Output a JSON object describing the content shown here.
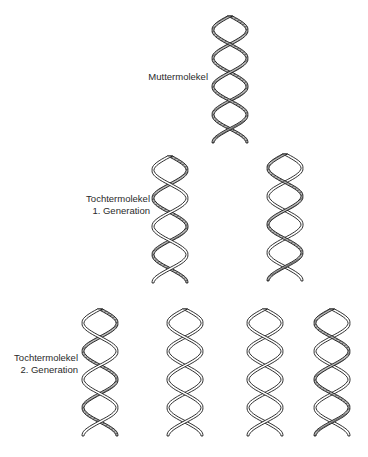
{
  "labels": {
    "mother": "Muttermolekel",
    "gen1_line1": "Tochtermolekel",
    "gen1_line2": "1. Generation",
    "gen2_line1": "Tochtermolekel",
    "gen2_line2": "2. Generation"
  },
  "colors": {
    "outline": "#1a1a1a",
    "hatched_fill": "#9a9a9a",
    "plain_fill": "#ffffff",
    "background": "#ffffff"
  },
  "molecules": [
    {
      "id": "mother",
      "generation": 0,
      "x": 210,
      "y": 12,
      "strand_a": "hatched",
      "strand_b": "hatched"
    },
    {
      "id": "gen1-left",
      "generation": 1,
      "x": 150,
      "y": 152,
      "strand_a": "hatched",
      "strand_b": "plain"
    },
    {
      "id": "gen1-right",
      "generation": 1,
      "x": 265,
      "y": 150,
      "strand_a": "plain",
      "strand_b": "hatched"
    },
    {
      "id": "gen2-1",
      "generation": 2,
      "x": 80,
      "y": 305,
      "strand_a": "hatched",
      "strand_b": "plain"
    },
    {
      "id": "gen2-2",
      "generation": 2,
      "x": 165,
      "y": 305,
      "strand_a": "plain",
      "strand_b": "plain"
    },
    {
      "id": "gen2-3",
      "generation": 2,
      "x": 245,
      "y": 305,
      "strand_a": "plain",
      "strand_b": "plain"
    },
    {
      "id": "gen2-4",
      "generation": 2,
      "x": 312,
      "y": 305,
      "strand_a": "plain",
      "strand_b": "hatched"
    }
  ]
}
